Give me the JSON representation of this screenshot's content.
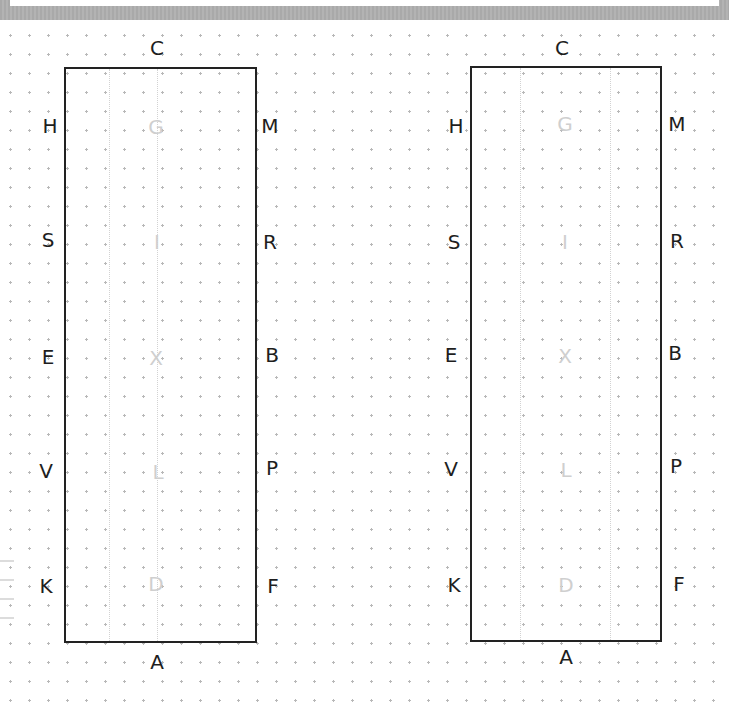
{
  "diagrams": [
    {
      "name": "left",
      "outer_labels": {
        "top": "C",
        "bottom": "A",
        "left": [
          "H",
          "S",
          "E",
          "V",
          "K"
        ],
        "right": [
          "M",
          "R",
          "B",
          "P",
          "F"
        ]
      },
      "inner_labels": [
        "G",
        "I",
        "X",
        "L",
        "D"
      ]
    },
    {
      "name": "right",
      "outer_labels": {
        "top": "C",
        "bottom": "A",
        "left": [
          "H",
          "S",
          "E",
          "V",
          "K"
        ],
        "right": [
          "M",
          "R",
          "B",
          "P",
          "F"
        ]
      },
      "inner_labels": [
        "G",
        "I",
        "X",
        "L",
        "D"
      ]
    }
  ],
  "colors": {
    "rectangle_border": "#222222",
    "outer_label": "#1e1e1e",
    "inner_label": "#cfcfcf",
    "dot_grid": "#b8b8b8",
    "top_bar": "#adadad"
  }
}
